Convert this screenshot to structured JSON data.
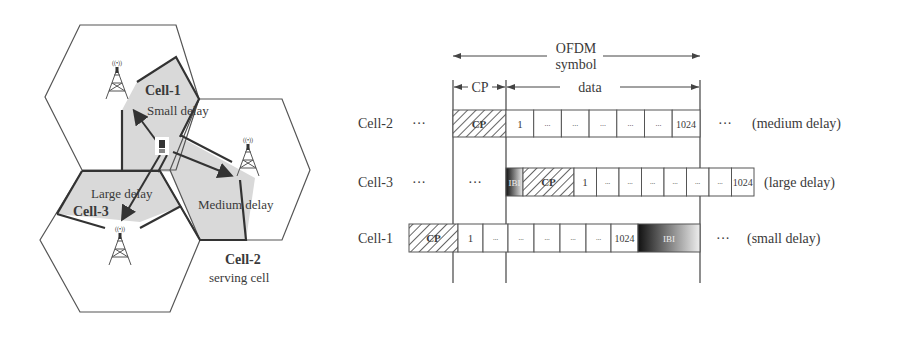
{
  "network": {
    "cells": [
      {
        "id": "cell-1",
        "label": "Cell-1",
        "note": "Small delay"
      },
      {
        "id": "cell-2",
        "label": "Cell-2",
        "note": "serving cell"
      },
      {
        "id": "cell-3",
        "label": "Cell-3",
        "note": ""
      }
    ],
    "delay_labels": {
      "small": "Small delay",
      "medium": "Medium delay",
      "large": "Large delay"
    },
    "tower_signal": "((•))"
  },
  "timing": {
    "ofdm_label_line1": "OFDM",
    "ofdm_label_line2": "symbol",
    "cp_label": "CP",
    "data_label": "data",
    "ellipsis": "···",
    "cell_dots": "...",
    "rows": [
      {
        "label": "Cell-2",
        "annotation": "(medium delay)",
        "first": "1",
        "last": "1024",
        "cp": "CP"
      },
      {
        "label": "Cell-3",
        "annotation": "(large delay)",
        "first": "1",
        "last": "1024",
        "cp": "CP",
        "ibi": "IBI"
      },
      {
        "label": "Cell-1",
        "annotation": "(small delay)",
        "first": "1",
        "last": "1024",
        "cp": "CP",
        "ibi": "IBI"
      }
    ]
  },
  "colors": {
    "shade": "#d9d9d9",
    "line": "#333333",
    "text": "#3a3a3a"
  }
}
